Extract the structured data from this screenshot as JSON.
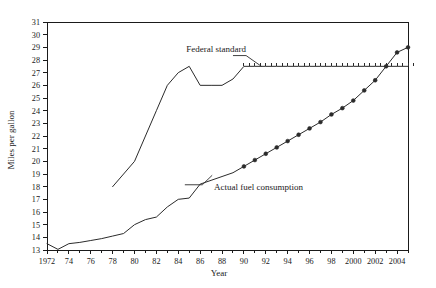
{
  "chart_data": {
    "type": "line",
    "title": "",
    "xlabel": "Year",
    "ylabel": "Miles per gallon",
    "xlim": [
      1972,
      2005
    ],
    "ylim": [
      13,
      31
    ],
    "grid": false,
    "legend_position": "inline-annotations",
    "x_tick_labels": [
      "1972",
      "74",
      "76",
      "78",
      "80",
      "82",
      "84",
      "86",
      "88",
      "90",
      "92",
      "94",
      "96",
      "98",
      "2000",
      "2002",
      "2004"
    ],
    "x_tick_values": [
      1972,
      1974,
      1976,
      1978,
      1980,
      1982,
      1984,
      1986,
      1988,
      1990,
      1992,
      1994,
      1996,
      1998,
      2000,
      2002,
      2004
    ],
    "y_tick_labels": [
      "13",
      "14",
      "15",
      "16",
      "17",
      "18",
      "19",
      "20",
      "21",
      "22",
      "23",
      "24",
      "25",
      "26",
      "27",
      "28",
      "29",
      "30",
      "31"
    ],
    "y_tick_values": [
      13,
      14,
      15,
      16,
      17,
      18,
      19,
      20,
      21,
      22,
      23,
      24,
      25,
      26,
      27,
      28,
      29,
      30,
      31
    ],
    "series": [
      {
        "name": "Federal standard",
        "label": "Federal standard",
        "style": "solid-line-with-tick-markers",
        "x": [
          1978,
          1979,
          1980,
          1981,
          1982,
          1983,
          1984,
          1985,
          1986,
          1987,
          1988,
          1989,
          1990,
          1991,
          1992,
          1993,
          1994,
          1995,
          1996,
          1997,
          1998,
          1999,
          2000,
          2001,
          2002,
          2003,
          2004,
          2005
        ],
        "values": [
          18.0,
          19.0,
          20.0,
          22.0,
          24.0,
          26.0,
          27.0,
          27.5,
          26.0,
          26.0,
          26.0,
          26.5,
          27.5,
          27.5,
          27.5,
          27.5,
          27.5,
          27.5,
          27.5,
          27.5,
          27.5,
          27.5,
          27.5,
          27.5,
          27.5,
          27.5,
          27.5,
          27.5
        ]
      },
      {
        "name": "Actual fuel consumption",
        "label": "Actual fuel consumption",
        "style": "solid-line-with-circle-markers-from-1990",
        "x": [
          1972,
          1973,
          1974,
          1975,
          1976,
          1977,
          1978,
          1979,
          1980,
          1981,
          1982,
          1983,
          1984,
          1985,
          1986,
          1987,
          1988,
          1989,
          1990,
          1991,
          1992,
          1993,
          1994,
          1995,
          1996,
          1997,
          1998,
          1999,
          2000,
          2001,
          2002,
          2003,
          2004,
          2005
        ],
        "values": [
          13.5,
          13.05,
          13.5,
          13.6,
          13.75,
          13.9,
          14.1,
          14.3,
          15.0,
          15.4,
          15.6,
          16.4,
          17.0,
          17.1,
          18.2,
          18.5,
          18.8,
          19.1,
          19.6,
          20.1,
          20.6,
          21.1,
          21.6,
          22.1,
          22.6,
          23.1,
          23.7,
          24.2,
          24.8,
          25.6,
          26.4,
          27.5,
          28.6,
          29.0
        ],
        "marker_start_year": 1990
      }
    ],
    "annotations": [
      {
        "text": "Federal standard",
        "x": 1990,
        "y": 28.6
      },
      {
        "text": "Actual fuel consumption",
        "x": 1987,
        "y": 18.0
      }
    ]
  }
}
